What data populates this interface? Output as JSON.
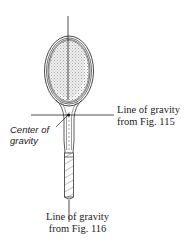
{
  "figure": {
    "labels": {
      "line_115_line1": "Line of gravity",
      "line_115_line2": "from Fig. 115",
      "center_line1": "Center of",
      "center_line2": "gravity",
      "line_116_line1": "Line of gravity",
      "line_116_line2": "from Fig. 116"
    },
    "colors": {
      "ink": "#222222",
      "background": "#ffffff",
      "shading": "#9a9a9a"
    }
  }
}
